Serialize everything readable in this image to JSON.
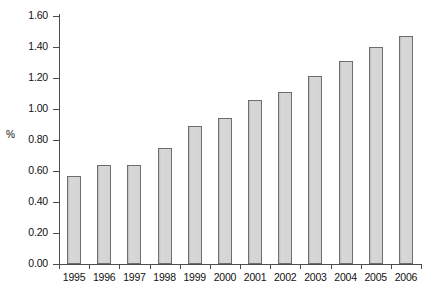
{
  "chart_data": {
    "type": "bar",
    "title": "",
    "xlabel": "",
    "ylabel": "%",
    "categories": [
      "1995",
      "1996",
      "1997",
      "1998",
      "1999",
      "2000",
      "2001",
      "2002",
      "2003",
      "2004",
      "2005",
      "2006"
    ],
    "values": [
      0.57,
      0.64,
      0.64,
      0.75,
      0.89,
      0.94,
      1.06,
      1.11,
      1.21,
      1.31,
      1.4,
      1.47
    ],
    "series": [
      {
        "name": "%",
        "values": [
          0.57,
          0.64,
          0.64,
          0.75,
          0.89,
          0.94,
          1.06,
          1.11,
          1.21,
          1.31,
          1.4,
          1.47
        ]
      }
    ],
    "ylim": [
      0.0,
      1.6
    ],
    "ytick_step": 0.2,
    "ytick_labels": [
      "1.60",
      "1.40",
      "1.20",
      "1.00",
      "0.80",
      "0.60",
      "0.40",
      "0.20",
      "0.00"
    ],
    "ytick_values": [
      1.6,
      1.4,
      1.2,
      1.0,
      0.8,
      0.6,
      0.4,
      0.2,
      0.0
    ],
    "grid": false,
    "legend": false,
    "legend_position": "none",
    "bar_fill_color": "#d2d2d2",
    "bar_border_color": "#6e6e6e",
    "axis_color": "#4d4d4d",
    "background_color": "#ffffff"
  }
}
